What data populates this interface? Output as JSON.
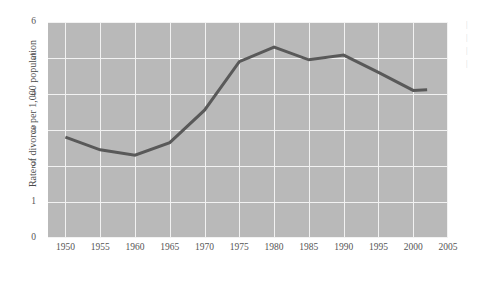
{
  "chart_data": {
    "type": "line",
    "title": "",
    "subtitle": "",
    "xlabel": "",
    "ylabel": "Rate of divorce per 1,000 population",
    "x": [
      1950,
      1955,
      1960,
      1965,
      1970,
      1975,
      1980,
      1985,
      1990,
      1995,
      2000,
      2002
    ],
    "values": [
      2.8,
      2.45,
      2.3,
      2.65,
      3.55,
      4.9,
      5.3,
      4.95,
      5.08,
      4.6,
      4.1,
      4.12
    ],
    "series": [
      {
        "name": "Rate of divorce per 1,000 population",
        "values": [
          2.8,
          2.45,
          2.3,
          2.65,
          3.55,
          4.9,
          5.3,
          4.95,
          5.08,
          4.6,
          4.1,
          4.12
        ]
      }
    ],
    "xlim": [
      1947.5,
      2005
    ],
    "ylim": [
      0,
      6
    ],
    "xticks": [
      1950,
      1955,
      1960,
      1965,
      1970,
      1975,
      1980,
      1985,
      1990,
      1995,
      2000,
      2005
    ],
    "xtick_labels": [
      "1950",
      "1955",
      "1960",
      "1965",
      "1970",
      "1975",
      "1980",
      "1985",
      "1990",
      "1995",
      "2000",
      "2005"
    ],
    "yticks": [
      0,
      1,
      2,
      3,
      4,
      5,
      6
    ],
    "ytick_labels": [
      "0",
      "1",
      "2",
      "3",
      "4",
      "5",
      "6"
    ],
    "grid": true,
    "legend": false,
    "legend_position": "none",
    "annotations": [],
    "colors": {
      "plot_background": "#b9b9b9",
      "gridline": "#f2f2f2",
      "line": "#595959",
      "tick_label": "#555555",
      "axis_title": "#4a4a4a",
      "page_background": "#ffffff"
    },
    "line_width": 3
  },
  "margin_note": {
    "lines": [
      "|",
      "|",
      "|",
      "|"
    ]
  }
}
